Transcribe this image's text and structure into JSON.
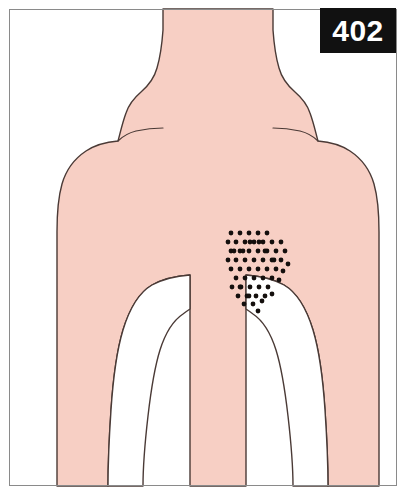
{
  "figure": {
    "badge_number": "402",
    "view": "posterior upper body",
    "colors": {
      "skin": "#f7cfc4",
      "outline": "#4a3a36",
      "frame": "#8a8a8a",
      "badge_background": "#111111",
      "badge_text": "#ffffff",
      "dot": "#140f0d",
      "background": "#ffffff"
    },
    "canvas": {
      "width": 407,
      "height": 496
    },
    "frame": {
      "x": 9,
      "y": 9,
      "width": 388,
      "height": 477
    },
    "badge": {
      "x": 320,
      "y": 8,
      "width": 76,
      "height": 45
    },
    "body_outline": {
      "head_neck_torso_path": "M 163 9 L 163 30 C 162 44 160 58 157 68 C 154 79 148 86 141 92 C 134 98 129 104 126 113 C 122 124 120 134 118 141 C 106 142 95 145 86 151 C 74 159 66 170 62 184 C 58 198 57 214 57 232 L 57 486 L 108 486 C 108 470 109 440 111 410 C 113 380 117 350 123 330 C 130 307 140 292 152 285 C 163 279 176 276 190 275 L 190 486 L 246 486 L 246 275 C 260 276 273 279 284 285 C 296 292 306 307 313 330 C 319 350 323 380 325 410 C 327 440 328 470 328 486 L 379 486 L 379 232 C 379 214 378 198 374 184 C 370 170 362 159 350 151 C 341 145 330 142 318 141 C 316 134 314 124 310 113 C 307 104 302 98 295 92 C 288 86 282 79 279 68 C 276 58 274 44 273 30 L 273 9 Z",
      "left_arm_gap_path": "M 190 275 C 176 276 163 279 152 285 C 140 292 130 307 123 330 C 117 350 113 380 111 410 C 109 440 108 470 108 486 L 143 486 C 143 470 145 442 148 416 C 151 390 155 366 160 350 C 166 331 174 320 183 314 C 187 311 190 309 190 309 Z",
      "right_arm_gap_path": "M 246 275 C 260 276 273 279 284 285 C 296 292 306 307 313 330 C 319 350 323 380 325 410 C 327 440 328 470 328 486 L 293 486 C 293 470 291 442 288 416 C 285 390 281 366 276 350 C 270 331 262 320 253 314 C 249 311 246 309 246 309 Z",
      "left_shoulder_crease": "M 118 141 C 122 137 128 133 136 131 C 145 129 154 128 163 128",
      "right_shoulder_crease": "M 318 141 C 314 137 308 133 300 131 C 291 129 282 128 273 128"
    },
    "dot_cluster": {
      "label": "referred pain area",
      "dot_radius": 2.4,
      "spacing_x": 9,
      "spacing_y": 9,
      "count": 62,
      "bounds": {
        "x_min": 228,
        "x_max": 292,
        "y_min": 231,
        "y_max": 311
      },
      "points": [
        [
          231,
          233
        ],
        [
          240,
          233
        ],
        [
          249,
          233
        ],
        [
          258,
          233
        ],
        [
          267,
          233
        ],
        [
          236,
          242
        ],
        [
          245,
          242
        ],
        [
          254,
          242
        ],
        [
          263,
          242
        ],
        [
          272,
          242
        ],
        [
          281,
          242
        ],
        [
          231,
          251
        ],
        [
          240,
          251
        ],
        [
          249,
          251
        ],
        [
          258,
          251
        ],
        [
          267,
          251
        ],
        [
          276,
          251
        ],
        [
          285,
          251
        ],
        [
          236,
          260
        ],
        [
          245,
          260
        ],
        [
          254,
          260
        ],
        [
          263,
          260
        ],
        [
          272,
          260
        ],
        [
          281,
          260
        ],
        [
          288,
          264
        ],
        [
          231,
          269
        ],
        [
          240,
          269
        ],
        [
          249,
          269
        ],
        [
          258,
          269
        ],
        [
          267,
          269
        ],
        [
          276,
          269
        ],
        [
          283,
          271
        ],
        [
          236,
          278
        ],
        [
          245,
          278
        ],
        [
          254,
          278
        ],
        [
          263,
          278
        ],
        [
          272,
          278
        ],
        [
          279,
          280
        ],
        [
          232,
          287
        ],
        [
          241,
          287
        ],
        [
          250,
          287
        ],
        [
          259,
          287
        ],
        [
          268,
          287
        ],
        [
          238,
          296
        ],
        [
          247,
          296
        ],
        [
          256,
          296
        ],
        [
          265,
          296
        ],
        [
          272,
          294
        ],
        [
          244,
          304
        ],
        [
          253,
          304
        ],
        [
          262,
          301
        ],
        [
          258,
          311
        ],
        [
          228,
          242
        ],
        [
          228,
          260
        ],
        [
          234,
          251
        ],
        [
          243,
          251
        ],
        [
          250,
          242
        ],
        [
          259,
          242
        ],
        [
          265,
          251
        ],
        [
          274,
          260
        ],
        [
          249,
          296
        ],
        [
          240,
          287
        ]
      ]
    }
  }
}
